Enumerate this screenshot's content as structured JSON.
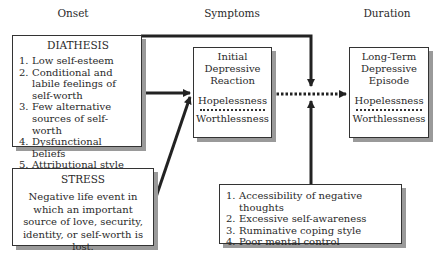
{
  "columns": {
    "onset": "Onset",
    "symptoms": "Symptoms",
    "duration": "Duration"
  },
  "diathesis": {
    "title": "DIATHESIS",
    "items": [
      {
        "num": "1.",
        "text": "Low self-esteem"
      },
      {
        "num": "2.",
        "text": "Conditional and labile feelings of self-worth"
      },
      {
        "num": "3.",
        "text": "Few alternative sources of self-worth"
      },
      {
        "num": "4.",
        "text": "Dysfunctional beliefs"
      },
      {
        "num": "5.",
        "text": "Attributional style"
      }
    ]
  },
  "stress": {
    "title": "STRESS",
    "text": "Negative life event in which an important source of love, security, identity, or self-worth is lost."
  },
  "initial": {
    "title_lines": [
      "Initial",
      "Depressive",
      "Reaction"
    ],
    "symptom1": "Hopelessness",
    "symptom2": "Worthlessness"
  },
  "longterm": {
    "title_lines": [
      "Long-Term",
      "Depressive",
      "Episode"
    ],
    "symptom1": "Hopelessness",
    "symptom2": "Worthlessness"
  },
  "maintaining": {
    "items": [
      {
        "num": "1.",
        "text": "Accessibility of negative thoughts"
      },
      {
        "num": "2.",
        "text": "Excessive self-awareness"
      },
      {
        "num": "3.",
        "text": "Ruminative coping style"
      },
      {
        "num": "4.",
        "text": "Poor mental control"
      }
    ]
  }
}
